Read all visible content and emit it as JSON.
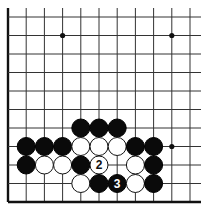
{
  "diagram": {
    "board": {
      "columns": 11,
      "rows": 11,
      "edges": [
        "left",
        "bottom"
      ],
      "open_sides": [
        "top",
        "right"
      ],
      "star_points": [
        [
          3,
          1
        ],
        [
          9,
          1
        ],
        [
          9,
          7
        ]
      ]
    },
    "colors": {
      "black_stone": "#0a0a0a",
      "white_stone": "#ffffff",
      "grid": "#333333",
      "background": "#ffffff"
    },
    "stones": [
      {
        "col": 4,
        "row": 6,
        "color": "black"
      },
      {
        "col": 5,
        "row": 6,
        "color": "black"
      },
      {
        "col": 6,
        "row": 6,
        "color": "black"
      },
      {
        "col": 1,
        "row": 7,
        "color": "black"
      },
      {
        "col": 2,
        "row": 7,
        "color": "black"
      },
      {
        "col": 3,
        "row": 7,
        "color": "black"
      },
      {
        "col": 4,
        "row": 7,
        "color": "white"
      },
      {
        "col": 5,
        "row": 7,
        "color": "white"
      },
      {
        "col": 6,
        "row": 7,
        "color": "white"
      },
      {
        "col": 7,
        "row": 7,
        "color": "black"
      },
      {
        "col": 8,
        "row": 7,
        "color": "black"
      },
      {
        "col": 1,
        "row": 8,
        "color": "black"
      },
      {
        "col": 2,
        "row": 8,
        "color": "white"
      },
      {
        "col": 3,
        "row": 8,
        "color": "white"
      },
      {
        "col": 4,
        "row": 8,
        "color": "black"
      },
      {
        "col": 5,
        "row": 8,
        "color": "white",
        "label": "2"
      },
      {
        "col": 7,
        "row": 8,
        "color": "white"
      },
      {
        "col": 8,
        "row": 8,
        "color": "black"
      },
      {
        "col": 4,
        "row": 9,
        "color": "white"
      },
      {
        "col": 5,
        "row": 9,
        "color": "black"
      },
      {
        "col": 6,
        "row": 9,
        "color": "black",
        "label": "3"
      },
      {
        "col": 7,
        "row": 9,
        "color": "white"
      },
      {
        "col": 8,
        "row": 9,
        "color": "black"
      }
    ]
  }
}
